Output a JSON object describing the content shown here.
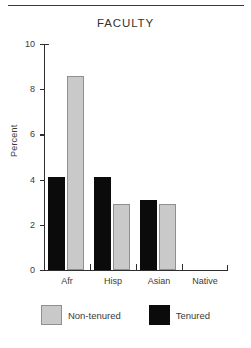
{
  "figure": {
    "title": "FACULTY",
    "top_rule": true
  },
  "chart_data": {
    "type": "bar",
    "title": "FACULTY",
    "xlabel": "",
    "ylabel": "Percent",
    "categories": [
      "Afr",
      "Hisp",
      "Asian",
      "Native"
    ],
    "series": [
      {
        "name": "Tenured",
        "color": "#0b0b0b",
        "values": [
          4.1,
          4.1,
          3.1,
          0.0
        ]
      },
      {
        "name": "Non-tenured",
        "color": "#c9c9c9",
        "values": [
          8.6,
          2.9,
          2.9,
          0.0
        ]
      }
    ],
    "ylim": [
      0,
      10
    ],
    "yticks": [
      0,
      2,
      4,
      6,
      8,
      10
    ],
    "ytick_labels": [
      "0",
      "2",
      "4",
      "6",
      "8",
      "10"
    ],
    "grid": false,
    "legend_position": "bottom",
    "bar_order_in_group": [
      "Tenured",
      "Non-tenured"
    ]
  },
  "legend": {
    "items": [
      {
        "label": "Non-tenured",
        "swatch": "gray-swatch"
      },
      {
        "label": "Tenured",
        "swatch": "black-swatch"
      }
    ]
  }
}
